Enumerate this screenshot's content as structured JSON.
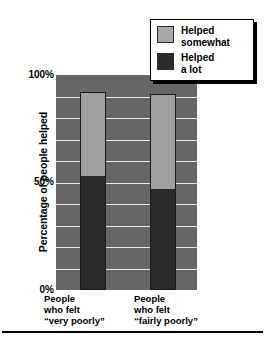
{
  "chart_data": {
    "type": "bar",
    "stacked": true,
    "title": "",
    "subtitle": "",
    "xlabel": "",
    "ylabel": "Percentage of people helped",
    "ylim": [
      0,
      100
    ],
    "ytick_labels": [
      "100%",
      "50%",
      "0%"
    ],
    "ytick_values": [
      100,
      50,
      0
    ],
    "grid": true,
    "grid_interval": 10,
    "legend_position": "top-right",
    "categories": [
      "People who felt “very poorly”",
      "People who felt “fairly poorly”"
    ],
    "series": [
      {
        "name": "Helped a lot",
        "values": [
          53,
          47
        ],
        "color": "#2b2b2b"
      },
      {
        "name": "Helped somewhat",
        "values": [
          39,
          44
        ],
        "color": "#a0a0a0"
      }
    ],
    "totals": [
      92,
      91
    ],
    "plot_background": "#666666",
    "gridline_color": "#e8e8e8"
  },
  "axis": {
    "y_title": "Percentage of people helped",
    "ticks": [
      {
        "label": "100%",
        "value": 100
      },
      {
        "label": "50%",
        "value": 50
      },
      {
        "label": "0%",
        "value": 0
      }
    ]
  },
  "legend": {
    "items": [
      {
        "label_line1": "Helped",
        "label_line2": "somewhat",
        "swatch": "#a8a8a8"
      },
      {
        "label_line1": "Helped",
        "label_line2": "a lot",
        "swatch": "#2b2b2b"
      }
    ]
  },
  "x_categories": [
    {
      "line1": "People",
      "line2": "who felt",
      "line3_open_quote": "“",
      "line3_emphasis": "very",
      "line3_rest": " poorly”"
    },
    {
      "line1": "People",
      "line2": "who felt",
      "line3_open_quote": "“",
      "line3_emphasis": "fairly",
      "line3_rest": " poorly”"
    }
  ],
  "bars": [
    {
      "alot_pct": 53,
      "somewhat_pct": 39,
      "total_pct": 92
    },
    {
      "alot_pct": 47,
      "somewhat_pct": 44,
      "total_pct": 91
    }
  ]
}
